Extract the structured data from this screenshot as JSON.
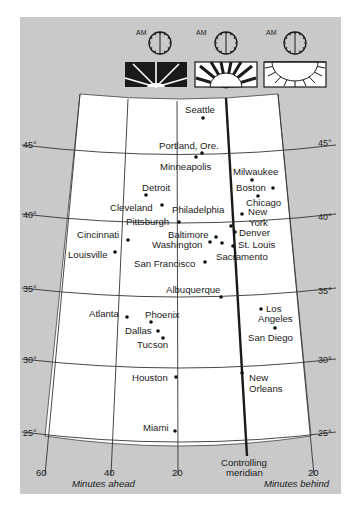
{
  "figure": {
    "colors": {
      "background": "#c9c9c9",
      "map_fill": "#ffffff",
      "line": "#2a2a2a",
      "controlling_meridian": "#2a2a2a"
    },
    "header": {
      "panels": [
        {
          "clock_label": "AM",
          "sun_state": "dark-sky-sun-rays"
        },
        {
          "clock_label": "AM",
          "sun_state": "half-sun-rising"
        },
        {
          "clock_label": "AM",
          "sun_state": "light-sky-sun"
        }
      ]
    },
    "latitude_labels": {
      "left": [
        "45°",
        "40°",
        "35°",
        "30°",
        "25°"
      ],
      "right": [
        "45°",
        "40°",
        "35°",
        "30°",
        "25°"
      ]
    },
    "cities": [
      {
        "name": "Seattle"
      },
      {
        "name": "Portland, Ore."
      },
      {
        "name": "Minneapolis"
      },
      {
        "name": "Milwaukee"
      },
      {
        "name": "Detroit"
      },
      {
        "name": "Boston"
      },
      {
        "name": "Cleveland"
      },
      {
        "name": "Philadelphia"
      },
      {
        "name": "Chicago"
      },
      {
        "name": "New"
      },
      {
        "name": "York"
      },
      {
        "name": "Pittsburgh"
      },
      {
        "name": "Denver"
      },
      {
        "name": "Cincinnati"
      },
      {
        "name": "Baltimore"
      },
      {
        "name": "Washington"
      },
      {
        "name": "St. Louis"
      },
      {
        "name": "Louisville"
      },
      {
        "name": "San Francisco"
      },
      {
        "name": "Sacramento"
      },
      {
        "name": "Albuquerque"
      },
      {
        "name": "Atlanta"
      },
      {
        "name": "Phoenix"
      },
      {
        "name": "Los"
      },
      {
        "name": "Angeles"
      },
      {
        "name": "Dallas"
      },
      {
        "name": "San Diego"
      },
      {
        "name": "Tucson"
      },
      {
        "name": "Houston"
      },
      {
        "name": "New"
      },
      {
        "name": "Orleans"
      },
      {
        "name": "Miami"
      }
    ],
    "axis": {
      "ticks": [
        "60",
        "40",
        "20",
        "20"
      ],
      "controlling_meridian_label_line1": "Controlling",
      "controlling_meridian_label_line2": "meridian",
      "left_title": "Minutes ahead",
      "right_title": "Minutes behind"
    }
  }
}
